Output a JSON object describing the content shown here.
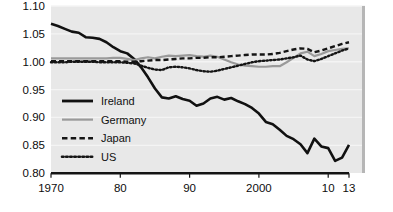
{
  "chart_data": {
    "type": "line",
    "title": "",
    "subtitle": "",
    "xlabel": "",
    "ylabel": "",
    "xlim": [
      1970,
      2013
    ],
    "ylim": [
      0.8,
      1.1
    ],
    "grid": true,
    "grid_axis": "y",
    "legend_position": "inside-left",
    "x_tick_labels": [
      "1970",
      "80",
      "90",
      "2000",
      "10",
      "13"
    ],
    "x_tick_values": [
      1970,
      1980,
      1990,
      2000,
      2010,
      2013
    ],
    "y_tick_labels": [
      "1.10",
      "1.05",
      "1.00",
      "0.95",
      "0.90",
      "0.85",
      "0.80"
    ],
    "y_tick_values": [
      1.1,
      1.05,
      1.0,
      0.95,
      0.9,
      0.85,
      0.8
    ],
    "x": [
      1970,
      1971,
      1972,
      1973,
      1974,
      1975,
      1976,
      1977,
      1978,
      1979,
      1980,
      1981,
      1982,
      1983,
      1984,
      1985,
      1986,
      1987,
      1988,
      1989,
      1990,
      1991,
      1992,
      1993,
      1994,
      1995,
      1996,
      1997,
      1998,
      1999,
      2000,
      2001,
      2002,
      2003,
      2004,
      2005,
      2006,
      2007,
      2008,
      2009,
      2010,
      2011,
      2012,
      2013
    ],
    "series": [
      {
        "name": "Ireland",
        "color": "#111111",
        "style": "solid",
        "width": 2.6,
        "values": [
          1.068,
          1.064,
          1.059,
          1.054,
          1.052,
          1.044,
          1.043,
          1.041,
          1.035,
          1.026,
          1.019,
          1.015,
          1.005,
          0.99,
          0.972,
          0.952,
          0.936,
          0.934,
          0.938,
          0.933,
          0.93,
          0.921,
          0.925,
          0.934,
          0.937,
          0.932,
          0.935,
          0.929,
          0.924,
          0.917,
          0.907,
          0.892,
          0.888,
          0.878,
          0.867,
          0.861,
          0.852,
          0.836,
          0.848,
          0.857,
          0.865,
          0.871,
          0.878,
          0.868
        ],
        "values_tail": [
          0.862,
          0.848,
          0.845,
          0.822,
          0.828,
          0.851
        ]
      },
      {
        "name": "Germany",
        "color": "#9a9a9a",
        "style": "solid",
        "width": 2.2,
        "values": [
          1.006,
          1.006,
          1.006,
          1.006,
          1.006,
          1.006,
          1.006,
          1.006,
          1.006,
          1.007,
          1.007,
          1.005,
          1.003,
          1.006,
          1.008,
          1.006,
          1.009,
          1.011,
          1.01,
          1.011,
          1.012,
          1.01,
          1.009,
          1.011,
          1.009,
          1.004,
          0.999,
          0.995,
          0.993,
          0.992,
          0.991,
          0.991,
          0.992,
          0.992,
          0.999,
          1.007,
          1.015,
          1.018,
          1.01,
          1.014,
          1.019,
          1.021,
          1.023,
          1.024
        ]
      },
      {
        "name": "Japan",
        "color": "#151515",
        "style": "dashed",
        "width": 2.4,
        "values": [
          1.001,
          1.001,
          1.001,
          1.001,
          1.001,
          1.001,
          1.001,
          1.001,
          1.001,
          1.001,
          1.001,
          1.0,
          1.0,
          1.001,
          1.002,
          1.003,
          1.003,
          1.004,
          1.005,
          1.006,
          1.006,
          1.007,
          1.007,
          1.008,
          1.008,
          1.009,
          1.01,
          1.011,
          1.012,
          1.013,
          1.013,
          1.013,
          1.014,
          1.016,
          1.019,
          1.022,
          1.024,
          1.023,
          1.017,
          1.02,
          1.024,
          1.028,
          1.032,
          1.035
        ]
      },
      {
        "name": "US",
        "color": "#151515",
        "style": "dotted",
        "width": 2.4,
        "values": [
          0.999,
          0.999,
          0.999,
          1.0,
          1.0,
          1.0,
          1.0,
          0.999,
          0.999,
          0.999,
          0.999,
          0.998,
          0.997,
          0.993,
          0.989,
          0.986,
          0.985,
          0.99,
          0.991,
          0.99,
          0.988,
          0.985,
          0.983,
          0.982,
          0.984,
          0.987,
          0.99,
          0.993,
          0.996,
          0.999,
          1.001,
          1.002,
          1.003,
          1.004,
          1.006,
          1.008,
          1.011,
          1.004,
          1.001,
          1.005,
          1.01,
          1.015,
          1.02,
          1.024
        ]
      }
    ],
    "legend": [
      {
        "label": "Ireland",
        "color": "#111111",
        "style": "solid"
      },
      {
        "label": "Germany",
        "color": "#9a9a9a",
        "style": "solid"
      },
      {
        "label": "Japan",
        "color": "#151515",
        "style": "dashed"
      },
      {
        "label": "US",
        "color": "#151515",
        "style": "dotted"
      }
    ],
    "plot_background": "#e8e8e8",
    "grid_color": "#f4f4f4",
    "axis_color": "#141414"
  }
}
